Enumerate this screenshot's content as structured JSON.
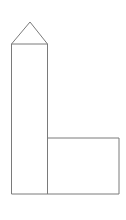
{
  "document": {
    "title": "Geometric Figure",
    "background_color": "#ffffff",
    "width": 126,
    "height": 220
  },
  "figure": {
    "name": "house-shaped-l-polygon",
    "description": "Line drawing of an L-shaped polygon topped by a triangular roof",
    "stroke_color": "#7a7a7a",
    "fill_color": "#ffffff",
    "stroke_width": 1,
    "parts": [
      {
        "name": "roof-triangle",
        "type": "triangle",
        "points": "30,22 47.5,44 11.5,44"
      },
      {
        "name": "tall-rectangle",
        "type": "rectangle",
        "x": 11.5,
        "y": 44,
        "width": 36,
        "height": 150
      },
      {
        "name": "lower-right-rectangle",
        "type": "rectangle",
        "x": 47.5,
        "y": 138,
        "width": 71.5,
        "height": 56
      }
    ],
    "outline_points": "30,22 47.5,44 47.5,138 119,138 119,194 11.5,194 11.5,44",
    "internal_edges": [
      {
        "name": "roof-base-line",
        "x1": 11.5,
        "y1": 44,
        "x2": 47.5,
        "y2": 44
      },
      {
        "name": "vertical-divider-line",
        "x1": 47.5,
        "y1": 138,
        "x2": 47.5,
        "y2": 194
      }
    ]
  }
}
